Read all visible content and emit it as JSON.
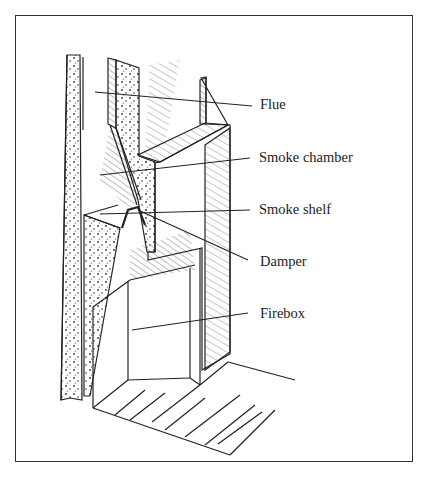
{
  "figure": {
    "labels": [
      {
        "id": "flue",
        "text": "Flue"
      },
      {
        "id": "smoke-chamber",
        "text": "Smoke chamber"
      },
      {
        "id": "smoke-shelf",
        "text": "Smoke shelf"
      },
      {
        "id": "damper",
        "text": "Damper"
      },
      {
        "id": "firebox",
        "text": "Firebox"
      }
    ]
  },
  "colors": {
    "ink": "#222222",
    "background": "#ffffff"
  }
}
